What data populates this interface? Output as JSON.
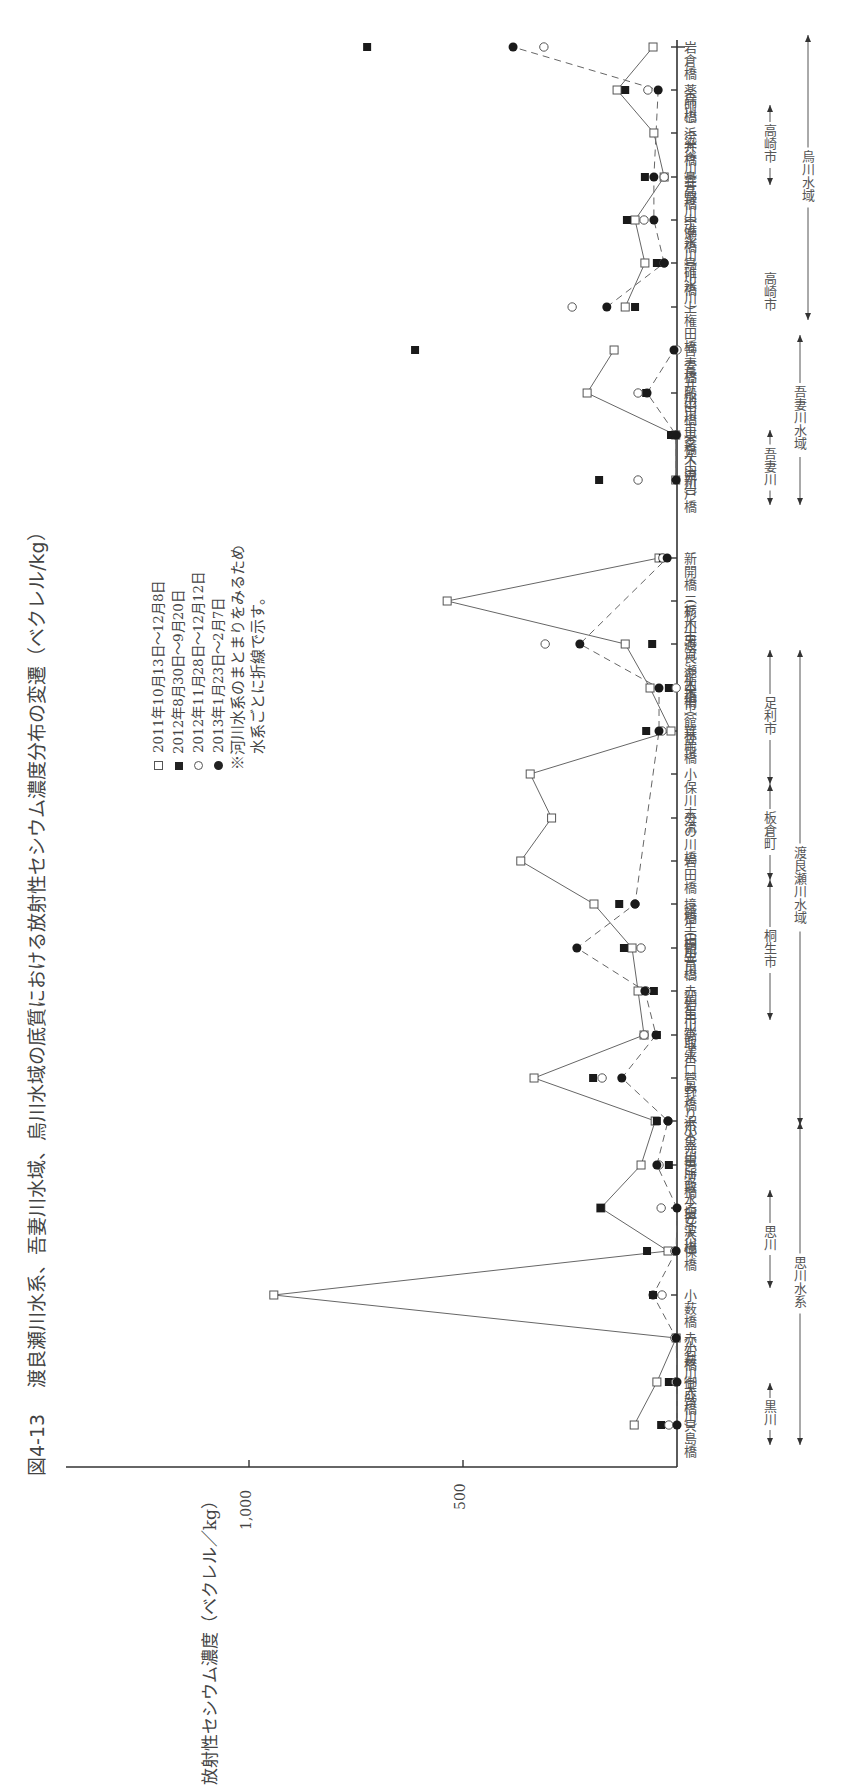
{
  "figure": {
    "number": "図4-13",
    "title": "渡良瀬川水系、吾妻川水域、烏川水域の底質における放射性セシウム濃度分布の変遷（ベクレル/kg）"
  },
  "axis": {
    "label": "放射性セシウム濃度（ベクレル／kg）",
    "ticks": [
      "1,000",
      "500"
    ]
  },
  "legend": {
    "items": [
      {
        "marker": "open-square",
        "label": "2011年10月13日～12月8日"
      },
      {
        "marker": "filled-square",
        "label": "2012年8月30日～9月20日"
      },
      {
        "marker": "open-circle",
        "label": "2012年11月28日～12月12日"
      },
      {
        "marker": "filled-circle",
        "label": "2013年1月23日～2月7日"
      }
    ],
    "note_line1": "※河川水系のまとまりをみるため",
    "note_line2": "水系ごとに折線で示す。"
  },
  "regions": [
    {
      "label": "←黒川→",
      "level": 1
    },
    {
      "label": "←思川→",
      "level": 1
    },
    {
      "label": "←思川水系→",
      "level": 2
    },
    {
      "label": "←桐生市→",
      "level": 1
    },
    {
      "label": "←板倉町→",
      "level": 1
    },
    {
      "label": "←足利市→",
      "level": 1
    },
    {
      "label": "←渡良瀬川水域→",
      "level": 2
    },
    {
      "label": "←吾妻川→",
      "level": 1
    },
    {
      "label": "←吾妻川水域→",
      "level": 2
    },
    {
      "label": "←高崎市→",
      "level": 1
    },
    {
      "label": "←高崎市→",
      "level": 1
    },
    {
      "label": "←烏川水域→",
      "level": 2
    }
  ],
  "chart_data": {
    "type": "line",
    "orientation": "rotated-90 (stations along vertical axis, concentration increases leftward)",
    "title": "渡良瀬川水系、吾妻川水域、烏川水域の底質における放射性セシウム濃度分布の変遷（ベクレル/kg）",
    "xlabel": "放射性セシウム濃度（ベクレル／kg）",
    "ylabel": "",
    "value_range": [
      0,
      1000
    ],
    "grid": false,
    "legend_position": "inside upper-left",
    "categories": [
      "貝島橋",
      "御成橋",
      "赤石橋（大芦川）",
      "小薮橋（小薮川）",
      "保橋",
      "乙女大橋",
      "巴波橋（巴波川）",
      "沢入発電所取水堰",
      "菅野橋（小黒川）",
      "高津戸（みどり市）",
      "赤岩用水取水口",
      "観音橋（桐生川）",
      "境橋（桐生川）",
      "岩田橋（鶴生田川）",
      "分の川橋",
      "小保川末流",
      "葉鹿橋",
      "中橋",
      "渡良瀬大橋（館林市）",
      "三杉川末流（栃木市）",
      "新開橋（栃木市）",
      "新戸橋",
      "東橋下流",
      "殿田橋（名久田川）",
      "吾妻橋（渋川市）",
      "上権田橋（長井川）",
      "鳥川橋",
      "中瀬橋（碓氷川）",
      "鼻高橋（碓氷川）",
      "浜井橋（井野川）",
      "薬師橋（染谷川）",
      "岩倉橋（烏川）"
    ],
    "groups": [
      {
        "name": "渡良瀬川水系",
        "start": 0,
        "end": 20
      },
      {
        "name": "吾妻川水域",
        "start": 21,
        "end": 24
      },
      {
        "name": "烏川水域",
        "start": 25,
        "end": 31
      }
    ],
    "series": [
      {
        "name": "2011年10月13日～12月8日",
        "marker": "open-square",
        "line": "solid",
        "values": [
          100,
          47,
          2,
          942,
          21,
          178,
          84,
          51,
          334,
          77,
          91,
          105,
          194,
          365,
          293,
          343,
          14,
          63,
          121,
          537,
          42,
          3,
          3,
          210,
          147,
          121,
          75,
          98,
          30,
          54,
          140,
          56
        ]
      },
      {
        "name": "2012年8月30日～9月20日",
        "marker": "filled-square",
        "line": "none",
        "values": [
          37,
          19,
          null,
          56,
          70,
          178,
          19,
          47,
          196,
          47,
          54,
          124,
          135,
          null,
          null,
          null,
          72,
          19,
          58,
          null,
          33,
          182,
          14,
          72,
          612,
          98,
          47,
          117,
          75,
          null,
          121,
          724
        ]
      },
      {
        "name": "2012年11月28日～12月12日",
        "marker": "open-circle",
        "line": "none",
        "values": [
          19,
          3,
          5,
          35,
          5,
          37,
          42,
          21,
          175,
          77,
          72,
          84,
          98,
          null,
          null,
          null,
          35,
          2,
          308,
          null,
          33,
          91,
          1,
          91,
          0,
          245,
          30,
          77,
          30,
          null,
          68,
          311
        ]
      },
      {
        "name": "2013年1月23日～2月7日",
        "marker": "filled-circle",
        "line": "dashed",
        "values": [
          0,
          0,
          2,
          56,
          2,
          0,
          47,
          21,
          129,
          49,
          75,
          234,
          98,
          null,
          null,
          null,
          42,
          42,
          227,
          null,
          23,
          2,
          2,
          70,
          7,
          164,
          30,
          54,
          54,
          null,
          44,
          383
        ]
      }
    ]
  }
}
